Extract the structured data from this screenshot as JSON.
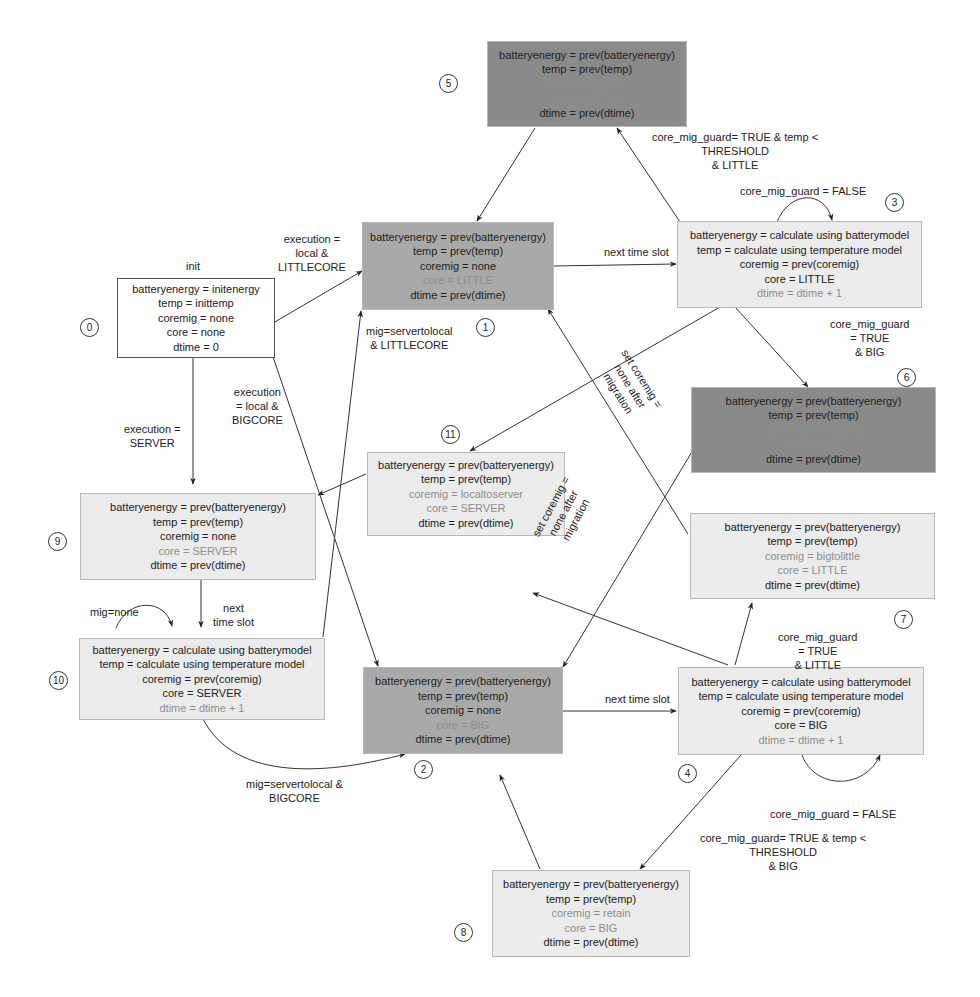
{
  "diagram": {
    "type": "state-machine",
    "init_label": "init",
    "states": [
      {
        "id": 0,
        "number": "0",
        "fill": "white",
        "lines": [
          {
            "text": "batteryenergy = initenergy",
            "dim": false
          },
          {
            "text": "temp = inittemp",
            "dim": false
          },
          {
            "text": "coremig = none",
            "dim": false
          },
          {
            "text": "core = none",
            "dim": false
          },
          {
            "text": "dtime = 0",
            "dim": false
          }
        ]
      },
      {
        "id": 1,
        "number": "1",
        "fill": "mid",
        "lines": [
          {
            "text": "batteryenergy = prev(batteryenergy)",
            "dim": false
          },
          {
            "text": "temp = prev(temp)",
            "dim": false
          },
          {
            "text": "coremig = none",
            "dim": false
          },
          {
            "text": "core = LITTLE",
            "dim": true
          },
          {
            "text": "dtime = prev(dtime)",
            "dim": false
          }
        ]
      },
      {
        "id": 2,
        "number": "2",
        "fill": "mid",
        "lines": [
          {
            "text": "batteryenergy = prev(batteryenergy)",
            "dim": false
          },
          {
            "text": "temp = prev(temp)",
            "dim": false
          },
          {
            "text": "coremig = none",
            "dim": false
          },
          {
            "text": "core = BIG",
            "dim": true
          },
          {
            "text": "dtime = prev(dtime)",
            "dim": false
          }
        ]
      },
      {
        "id": 3,
        "number": "3",
        "fill": "light",
        "lines": [
          {
            "text": "batteryenergy = calculate using batterymodel",
            "dim": false
          },
          {
            "text": "temp = calculate using temperature model",
            "dim": false
          },
          {
            "text": "coremig = prev(coremig)",
            "dim": false
          },
          {
            "text": "core = LITTLE",
            "dim": false
          },
          {
            "text": "dtime = dtime + 1",
            "dim": true
          }
        ]
      },
      {
        "id": 4,
        "number": "4",
        "fill": "light",
        "lines": [
          {
            "text": "batteryenergy = calculate using batterymodel",
            "dim": false
          },
          {
            "text": "temp = calculate using temperature model",
            "dim": false
          },
          {
            "text": "coremig = prev(coremig)",
            "dim": false
          },
          {
            "text": "core = BIG",
            "dim": false
          },
          {
            "text": "dtime = dtime + 1",
            "dim": true
          }
        ]
      },
      {
        "id": 5,
        "number": "5",
        "fill": "dark",
        "lines": [
          {
            "text": "batteryenergy = prev(batteryenergy)",
            "dim": false
          },
          {
            "text": "temp = prev(temp)",
            "dim": false
          },
          {
            "text": "coremig = retain",
            "dim": true
          },
          {
            "text": "core = LITTLE",
            "dim": true
          },
          {
            "text": "dtime = prev(dtime)",
            "dim": false
          }
        ]
      },
      {
        "id": 6,
        "number": "6",
        "fill": "dark",
        "lines": [
          {
            "text": "batteryenergy = prev(batteryenergy)",
            "dim": false
          },
          {
            "text": "temp = prev(temp)",
            "dim": false
          },
          {
            "text": "coremig = littletobig",
            "dim": true
          },
          {
            "text": "core = BIG",
            "dim": true
          },
          {
            "text": "dtime = prev(dtime)",
            "dim": false
          }
        ]
      },
      {
        "id": 7,
        "number": "7",
        "fill": "light",
        "lines": [
          {
            "text": "batteryenergy = prev(batteryenergy)",
            "dim": false
          },
          {
            "text": "temp = prev(temp)",
            "dim": false
          },
          {
            "text": "coremig = bigtolittle",
            "dim": true
          },
          {
            "text": "core = LITTLE",
            "dim": true
          },
          {
            "text": "dtime = prev(dtime)",
            "dim": false
          }
        ]
      },
      {
        "id": 8,
        "number": "8",
        "fill": "light",
        "lines": [
          {
            "text": "batteryenergy = prev(batteryenergy)",
            "dim": false
          },
          {
            "text": "temp = prev(temp)",
            "dim": false
          },
          {
            "text": "coremig = retain",
            "dim": true
          },
          {
            "text": "core = BIG",
            "dim": true
          },
          {
            "text": "dtime = prev(dtime)",
            "dim": false
          }
        ]
      },
      {
        "id": 9,
        "number": "9",
        "fill": "light",
        "lines": [
          {
            "text": "batteryenergy = prev(batteryenergy)",
            "dim": false
          },
          {
            "text": "temp = prev(temp)",
            "dim": false
          },
          {
            "text": "coremig = none",
            "dim": false
          },
          {
            "text": "core = SERVER",
            "dim": true
          },
          {
            "text": "dtime = prev(dtime)",
            "dim": false
          }
        ]
      },
      {
        "id": 10,
        "number": "10",
        "fill": "light",
        "lines": [
          {
            "text": "batteryenergy = calculate using batterymodel",
            "dim": false
          },
          {
            "text": "temp = calculate using temperature model",
            "dim": false
          },
          {
            "text": "coremig = prev(coremig)",
            "dim": false
          },
          {
            "text": "core = SERVER",
            "dim": false
          },
          {
            "text": "dtime = dtime + 1",
            "dim": true
          }
        ]
      },
      {
        "id": 11,
        "number": "11",
        "fill": "light",
        "lines": [
          {
            "text": "batteryenergy = prev(batteryenergy)",
            "dim": false
          },
          {
            "text": "temp = prev(temp)",
            "dim": false
          },
          {
            "text": "coremig = localtoserver",
            "dim": true
          },
          {
            "text": "core = SERVER",
            "dim": true
          },
          {
            "text": "dtime = prev(dtime)",
            "dim": false
          }
        ]
      }
    ],
    "transitions": [
      {
        "from": 0,
        "to": 1,
        "label": [
          "execution =",
          "local &",
          "LITTLECORE"
        ]
      },
      {
        "from": 0,
        "to": 2,
        "label": [
          "execution",
          "= local &",
          "BIGCORE"
        ]
      },
      {
        "from": 0,
        "to": 9,
        "label": [
          "execution =",
          "SERVER"
        ]
      },
      {
        "from": 1,
        "to": 3,
        "label": [
          "next time slot"
        ]
      },
      {
        "from": 2,
        "to": 4,
        "label": [
          "next time slot"
        ]
      },
      {
        "from": 3,
        "to": 3,
        "label": [
          "core_mig_guard = FALSE"
        ]
      },
      {
        "from": 3,
        "to": 5,
        "label": [
          "core_mig_guard= TRUE & temp <",
          "THRESHOLD",
          "& LITTLE"
        ]
      },
      {
        "from": 3,
        "to": 6,
        "label": [
          "core_mig_guard",
          "= TRUE",
          "& BIG"
        ]
      },
      {
        "from": 3,
        "to": 11,
        "label": []
      },
      {
        "from": 4,
        "to": 4,
        "label": [
          "core_mig_guard = FALSE"
        ]
      },
      {
        "from": 4,
        "to": 7,
        "label": [
          "core_mig_guard",
          "= TRUE",
          "& LITTLE"
        ]
      },
      {
        "from": 4,
        "to": 8,
        "label": [
          "core_mig_guard= TRUE & temp <",
          "THRESHOLD",
          "& BIG"
        ]
      },
      {
        "from": 4,
        "to": 11,
        "label": []
      },
      {
        "from": 5,
        "to": 1,
        "label": []
      },
      {
        "from": 6,
        "to": 2,
        "label": [
          "set coremig =",
          "none after",
          "migration"
        ]
      },
      {
        "from": 7,
        "to": 1,
        "label": [
          "set coremig =",
          "none after",
          "migration"
        ]
      },
      {
        "from": 8,
        "to": 2,
        "label": []
      },
      {
        "from": 9,
        "to": 10,
        "label": [
          "next",
          "time slot"
        ]
      },
      {
        "from": 10,
        "to": 10,
        "label": [
          "mig=none"
        ]
      },
      {
        "from": 10,
        "to": 1,
        "label": [
          "mig=servertolocal",
          "& LITTLECORE"
        ]
      },
      {
        "from": 10,
        "to": 2,
        "label": [
          "mig=servertolocal &",
          "BIGCORE"
        ]
      },
      {
        "from": 11,
        "to": 9,
        "label": []
      }
    ]
  }
}
